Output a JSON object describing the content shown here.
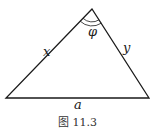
{
  "figure": {
    "caption": "图 11.3",
    "labels": {
      "left_side": "x",
      "right_side": "y",
      "base": "a",
      "apex_angle": "φ"
    },
    "colors": {
      "stroke": "#1a1a1a",
      "background": "#ffffff"
    }
  }
}
